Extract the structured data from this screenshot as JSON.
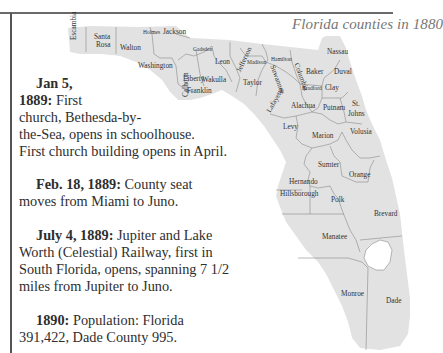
{
  "map": {
    "title": "Florida counties in 1880",
    "counties": [
      {
        "name": "Escambia",
        "x": 70,
        "y": 40,
        "rotate": -90
      },
      {
        "name": "Santa",
        "x": 94,
        "y": 33
      },
      {
        "name": "Rosa",
        "x": 96,
        "y": 41
      },
      {
        "name": "Walton",
        "x": 120,
        "y": 44
      },
      {
        "name": "Holmes",
        "x": 143,
        "y": 28,
        "small": true
      },
      {
        "name": "Jackson",
        "x": 163,
        "y": 28
      },
      {
        "name": "Washington",
        "x": 138,
        "y": 62
      },
      {
        "name": "Gadsden",
        "x": 193,
        "y": 45,
        "small": true
      },
      {
        "name": "Calhoun",
        "x": 182,
        "y": 97,
        "rotate": -90
      },
      {
        "name": "Liberty",
        "x": 183,
        "y": 75
      },
      {
        "name": "Wakulla",
        "x": 202,
        "y": 76
      },
      {
        "name": "Leon",
        "x": 215,
        "y": 58
      },
      {
        "name": "Franklin",
        "x": 187,
        "y": 87
      },
      {
        "name": "Jefferson",
        "x": 235,
        "y": 70,
        "rotate": -65
      },
      {
        "name": "Madison",
        "x": 247,
        "y": 58,
        "small": true
      },
      {
        "name": "Hamilton",
        "x": 271,
        "y": 55,
        "small": true
      },
      {
        "name": "Taylor",
        "x": 243,
        "y": 79
      },
      {
        "name": "Suwannee",
        "x": 276,
        "y": 64,
        "rotate": 70
      },
      {
        "name": "Columbia",
        "x": 300,
        "y": 62,
        "rotate": 70
      },
      {
        "name": "Lafayette",
        "x": 265,
        "y": 110,
        "rotate": -60
      },
      {
        "name": "Baker",
        "x": 306,
        "y": 68
      },
      {
        "name": "Nassau",
        "x": 327,
        "y": 48
      },
      {
        "name": "Duval",
        "x": 334,
        "y": 68
      },
      {
        "name": "Bradford",
        "x": 302,
        "y": 84,
        "small": true
      },
      {
        "name": "Clay",
        "x": 325,
        "y": 84
      },
      {
        "name": "Alachua",
        "x": 291,
        "y": 102
      },
      {
        "name": "Putnam",
        "x": 323,
        "y": 104
      },
      {
        "name": "St.",
        "x": 352,
        "y": 100
      },
      {
        "name": "Johns",
        "x": 348,
        "y": 110
      },
      {
        "name": "Levy",
        "x": 283,
        "y": 123
      },
      {
        "name": "Marion",
        "x": 312,
        "y": 132
      },
      {
        "name": "Volusia",
        "x": 350,
        "y": 128
      },
      {
        "name": "Sumter",
        "x": 318,
        "y": 161
      },
      {
        "name": "Orange",
        "x": 349,
        "y": 171
      },
      {
        "name": "Hernando",
        "x": 289,
        "y": 178
      },
      {
        "name": "Hillsborough",
        "x": 280,
        "y": 190
      },
      {
        "name": "Polk",
        "x": 331,
        "y": 196
      },
      {
        "name": "Brevard",
        "x": 374,
        "y": 210
      },
      {
        "name": "Manatee",
        "x": 322,
        "y": 233
      },
      {
        "name": "Monroe",
        "x": 341,
        "y": 290
      },
      {
        "name": "Dade",
        "x": 386,
        "y": 297
      }
    ]
  },
  "timeline": [
    {
      "date": "Jan 5,",
      "date2": "1889:",
      "lines": [
        "First",
        "church, Bethesda-by-",
        "the-Sea, opens in schoolhouse.",
        "First church building opens in April."
      ]
    },
    {
      "date": "Feb. 18, 1889:",
      "text": "County seat",
      "lines": [
        "moves from Miami to Juno."
      ]
    },
    {
      "date": "July 4, 1889:",
      "text": "Jupiter and Lake",
      "lines": [
        "Worth (Celestial) Railway, first in",
        "South Florida, opens, spanning 7 1/2",
        "miles from Jupiter to Juno."
      ]
    },
    {
      "date": "1890:",
      "text": "Population: Florida",
      "lines": [
        "391,422, Dade County 995."
      ]
    }
  ]
}
